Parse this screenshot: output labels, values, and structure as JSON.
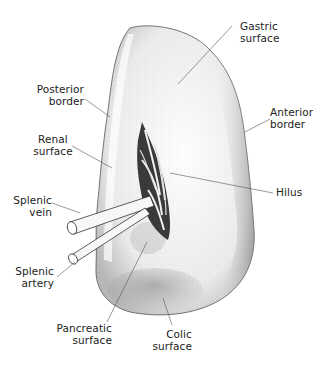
{
  "diagram": {
    "labels": {
      "gastric_surface": {
        "line1": "Gastric",
        "line2": "surface"
      },
      "posterior_border": {
        "line1": "Posterior",
        "line2": "border"
      },
      "anterior_border": {
        "line1": "Anterior",
        "line2": "border"
      },
      "renal_surface": {
        "line1": "Renal",
        "line2": "surface"
      },
      "hilus": {
        "line1": "Hilus"
      },
      "splenic_vein": {
        "line1": "Splenic",
        "line2": "vein"
      },
      "splenic_artery": {
        "line1": "Splenic",
        "line2": "artery"
      },
      "pancreatic_surface": {
        "line1": "Pancreatic",
        "line2": "surface"
      },
      "colic_surface": {
        "line1": "Colic",
        "line2": "surface"
      }
    },
    "colors": {
      "background": "#ffffff",
      "ink": "#222222",
      "organ_fill": "#f4f4f4",
      "stipple": "#8a8a8a",
      "hilus_dark": "#2a2a2a"
    }
  }
}
